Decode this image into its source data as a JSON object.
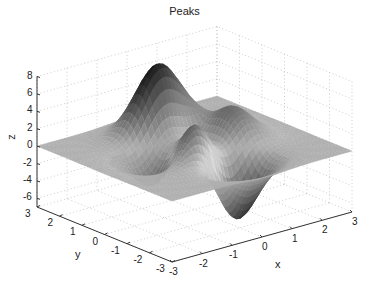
{
  "chart_data": {
    "type": "surface3d",
    "title": "Peaks",
    "xlabel": "x",
    "ylabel": "y",
    "zlabel": "z",
    "function": "peaks(x,y) = 3(1-x)^2 e^(-x^2-(y+1)^2) - 10(x/5 - x^3 - y^5) e^(-x^2-y^2) - 1/3 e^(-(x+1)^2-y^2)",
    "xlim": [
      -3,
      3
    ],
    "ylim": [
      -3,
      3
    ],
    "zlim": [
      -7,
      8
    ],
    "x_ticks": [
      "-3",
      "-2",
      "-1",
      "0",
      "1",
      "2",
      "3"
    ],
    "y_ticks": [
      "-3",
      "-2",
      "-1",
      "0",
      "1",
      "2",
      "3"
    ],
    "z_ticks": [
      "-6",
      "-4",
      "-2",
      "0",
      "2",
      "4",
      "6",
      "8"
    ],
    "grid": true,
    "colormap": "gray",
    "features": [
      {
        "name": "main peak",
        "x": 0,
        "y": 1.6,
        "z": 8.1
      },
      {
        "name": "secondary peak",
        "x": -0.5,
        "y": 0,
        "z": 3.8
      },
      {
        "name": "small peak",
        "x": 1.3,
        "y": 0,
        "z": 3.6
      },
      {
        "name": "deep valley",
        "x": 0.2,
        "y": -1.6,
        "z": -6.5
      },
      {
        "name": "shallow valley",
        "x": -1.4,
        "y": 0.2,
        "z": -3.0
      }
    ]
  },
  "labels": {
    "title": "Peaks",
    "x": "x",
    "y": "y",
    "z": "z"
  }
}
